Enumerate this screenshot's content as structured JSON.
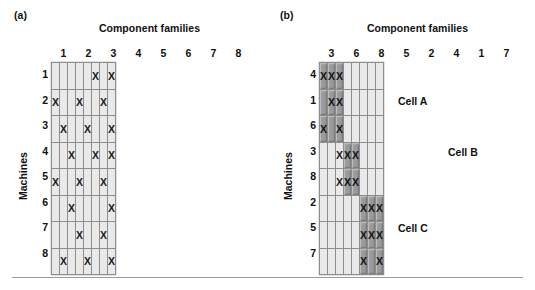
{
  "figure": {
    "panels": [
      {
        "tag": "(a)",
        "col_axis_title": "Component families",
        "row_axis_title": "Machines",
        "columns": [
          "1",
          "2",
          "3",
          "4",
          "5",
          "6",
          "7",
          "8"
        ],
        "rows": [
          "1",
          "2",
          "3",
          "4",
          "5",
          "6",
          "7",
          "8"
        ],
        "mark": "X",
        "cell_labels": []
      },
      {
        "tag": "(b)",
        "col_axis_title": "Component families",
        "row_axis_title": "Machines",
        "columns": [
          "3",
          "6",
          "8",
          "5",
          "2",
          "4",
          "1",
          "7"
        ],
        "rows": [
          "4",
          "1",
          "6",
          "3",
          "8",
          "2",
          "5",
          "7"
        ],
        "mark": "X",
        "cell_labels": [
          {
            "text": "Cell A",
            "row": 1,
            "col": 3
          },
          {
            "text": "Cell B",
            "row": 3,
            "col": 5
          },
          {
            "text": "Cell C",
            "row": 6,
            "col": 3
          }
        ]
      }
    ]
  },
  "chart_data": {
    "type": "heatmap",
    "subplots": [
      {
        "tag": "(a)",
        "title": "",
        "xlabel": "Component families",
        "ylabel": "Machines",
        "xtick_labels": [
          "1",
          "2",
          "3",
          "4",
          "5",
          "6",
          "7",
          "8"
        ],
        "ytick_labels": [
          "1",
          "2",
          "3",
          "4",
          "5",
          "6",
          "7",
          "8"
        ],
        "grid": true,
        "legend": "none",
        "cell_states": [
          "empty",
          "marked"
        ],
        "marks": [
          [
            0,
            0,
            0,
            0,
            0,
            1,
            0,
            1
          ],
          [
            1,
            0,
            0,
            1,
            0,
            0,
            1,
            0
          ],
          [
            0,
            1,
            0,
            0,
            1,
            0,
            0,
            1
          ],
          [
            0,
            0,
            1,
            0,
            0,
            1,
            0,
            1
          ],
          [
            1,
            0,
            0,
            1,
            0,
            0,
            1,
            0
          ],
          [
            0,
            0,
            1,
            0,
            0,
            0,
            0,
            1
          ],
          [
            0,
            0,
            0,
            1,
            0,
            0,
            1,
            0
          ],
          [
            0,
            1,
            0,
            0,
            1,
            0,
            0,
            1
          ]
        ],
        "shaded": [
          [
            0,
            0,
            0,
            0,
            0,
            0,
            0,
            0
          ],
          [
            0,
            0,
            0,
            0,
            0,
            0,
            0,
            0
          ],
          [
            0,
            0,
            0,
            0,
            0,
            0,
            0,
            0
          ],
          [
            0,
            0,
            0,
            0,
            0,
            0,
            0,
            0
          ],
          [
            0,
            0,
            0,
            0,
            0,
            0,
            0,
            0
          ],
          [
            0,
            0,
            0,
            0,
            0,
            0,
            0,
            0
          ],
          [
            0,
            0,
            0,
            0,
            0,
            0,
            0,
            0
          ],
          [
            0,
            0,
            0,
            0,
            0,
            0,
            0,
            0
          ]
        ]
      },
      {
        "tag": "(b)",
        "title": "",
        "xlabel": "Component families",
        "ylabel": "Machines",
        "xtick_labels": [
          "3",
          "6",
          "8",
          "5",
          "2",
          "4",
          "1",
          "7"
        ],
        "ytick_labels": [
          "4",
          "1",
          "6",
          "3",
          "8",
          "2",
          "5",
          "7"
        ],
        "grid": true,
        "legend": "none",
        "cell_states": [
          "empty",
          "marked",
          "shaded",
          "shaded-marked"
        ],
        "annotations": [
          "Cell A",
          "Cell B",
          "Cell C"
        ],
        "marks": [
          [
            1,
            1,
            1,
            0,
            0,
            0,
            0,
            0
          ],
          [
            0,
            1,
            1,
            0,
            0,
            0,
            0,
            0
          ],
          [
            1,
            0,
            1,
            0,
            0,
            0,
            0,
            0
          ],
          [
            0,
            0,
            1,
            1,
            1,
            0,
            0,
            0
          ],
          [
            0,
            0,
            1,
            1,
            1,
            0,
            0,
            0
          ],
          [
            0,
            0,
            0,
            0,
            0,
            1,
            1,
            1
          ],
          [
            0,
            0,
            0,
            0,
            0,
            1,
            1,
            1
          ],
          [
            0,
            0,
            0,
            0,
            0,
            1,
            0,
            1
          ]
        ],
        "shaded": [
          [
            1,
            1,
            1,
            0,
            0,
            0,
            0,
            0
          ],
          [
            1,
            1,
            1,
            0,
            0,
            0,
            0,
            0
          ],
          [
            1,
            1,
            1,
            0,
            0,
            0,
            0,
            0
          ],
          [
            0,
            0,
            0,
            1,
            1,
            0,
            0,
            0
          ],
          [
            0,
            0,
            0,
            1,
            1,
            0,
            0,
            0
          ],
          [
            0,
            0,
            0,
            0,
            0,
            1,
            1,
            1
          ],
          [
            0,
            0,
            0,
            0,
            0,
            1,
            1,
            1
          ],
          [
            0,
            0,
            0,
            0,
            0,
            1,
            1,
            1
          ]
        ]
      }
    ]
  }
}
